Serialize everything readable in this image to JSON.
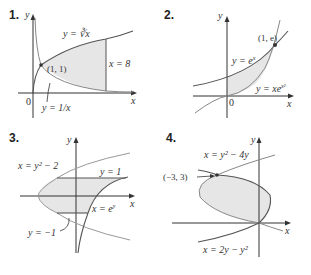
{
  "panels": [
    {
      "number": "1.",
      "labels": {
        "y_axis": "y",
        "x_axis": "x",
        "origin": "0",
        "curve_top": "y = ∛x",
        "curve_bottom": "y = 1/x",
        "point": "(1, 1)",
        "vline": "x = 8"
      }
    },
    {
      "number": "2.",
      "labels": {
        "y_axis": "y",
        "x_axis": "x",
        "origin": "0",
        "curve_top": "y = e",
        "curve_top_exp": "x",
        "curve_bottom": "y = xe",
        "curve_bottom_exp": "x²",
        "point": "(1, e)"
      }
    },
    {
      "number": "3.",
      "labels": {
        "y_axis": "y",
        "x_axis": "x",
        "parabola": "x = y² − 2",
        "line_top": "y = 1",
        "line_bottom": "y = −1",
        "curve_exp": "x = e",
        "curve_exp_sup": "y"
      }
    },
    {
      "number": "4.",
      "labels": {
        "y_axis": "y",
        "x_axis": "x",
        "curve_a": "x = y² − 4y",
        "curve_b": "x = 2y − y²",
        "point": "(−3, 3)"
      }
    }
  ],
  "colors": {
    "axis": "#333333",
    "curve_dark": "#555555",
    "curve_light": "#999999",
    "fill": "#e6e6e6"
  }
}
